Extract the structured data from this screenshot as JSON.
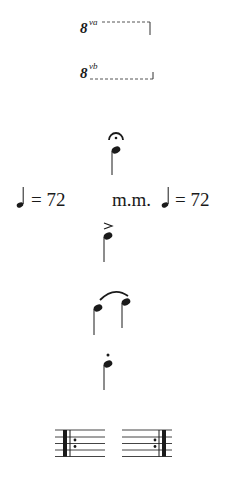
{
  "symbols": {
    "ottava_alta": {
      "numeral": "8",
      "suffix": "va",
      "name": "8va"
    },
    "ottava_bassa": {
      "numeral": "8",
      "suffix": "vb",
      "name": "8vb"
    },
    "fermata": {
      "name": "fermata"
    },
    "tempo_left": {
      "equals": "=",
      "bpm": "72",
      "text": "= 72"
    },
    "tempo_right": {
      "prefix": "m.m.",
      "equals": "=",
      "bpm": "72",
      "text": "= 72"
    },
    "accent": {
      "name": "accent",
      "glyph": ">"
    },
    "tie": {
      "name": "tie"
    },
    "staccato": {
      "name": "staccato"
    },
    "repeat_start": {
      "name": "repeat-start"
    },
    "repeat_end": {
      "name": "repeat-end"
    }
  },
  "colors": {
    "ink": "#1a1a1a",
    "background": "#ffffff"
  }
}
